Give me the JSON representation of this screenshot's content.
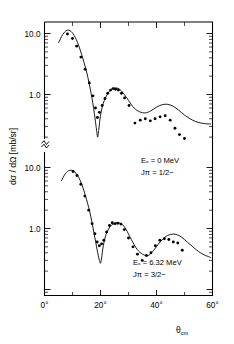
{
  "figure": {
    "name": "differential-cross-section-angular-distribution",
    "background": "#ffffff",
    "ink_color": "#000000"
  },
  "axes": {
    "x": {
      "label_main": "θ",
      "label_sub": "cm",
      "min": 0,
      "max": 60,
      "unit": "deg",
      "major_ticks": [
        0,
        20,
        40,
        60
      ],
      "major_tick_labels": [
        "0°",
        "20°",
        "40°",
        "60°"
      ],
      "minor_ticks": [
        10,
        30,
        50
      ]
    },
    "y": {
      "label": "dσ / dΩ [mb/sr]",
      "scale": "log",
      "unit": "mb/sr",
      "axis_break": true,
      "axis_break_symbol": "≈",
      "panel_tick_labels": [
        "10.0",
        "1.0"
      ]
    }
  },
  "chart_data": {
    "type": "scatter",
    "title": "",
    "xlabel": "θ_cm",
    "ylabel": "dσ / dΩ [mb/sr]",
    "xlim": [
      0,
      60
    ],
    "yscale": "log",
    "grid": false,
    "legend": "none",
    "panels": [
      {
        "id": "upper-panel",
        "annotation_lines": [
          "E",
          "x",
          " = 0 MeV",
          "J",
          "π",
          " = 1/2",
          "−"
        ],
        "annotation_excitation": "Eₓ = 0 MeV",
        "annotation_spin_parity": "Jπ = 1/2−",
        "excitation_energy_MeV": 0,
        "spin": "1/2",
        "parity": "-",
        "ylim": [
          0.1,
          30
        ],
        "ytick_values": [
          10.0,
          1.0
        ],
        "ytick_labels": [
          "10.0",
          "1.0"
        ],
        "series": [
          {
            "name": "experimental-data",
            "marker": "filled-circle",
            "x": [
              8.2,
              10.0,
              11.5,
              13.0,
              14.5,
              16.0,
              17.3,
              18.2,
              18.9,
              19.6,
              20.6,
              21.6,
              22.6,
              23.6,
              24.5,
              25.4,
              26.4,
              27.5,
              28.6,
              30.2,
              32.3,
              34.2,
              36.0,
              37.8,
              39.5,
              41.3,
              43.1,
              44.9,
              46.6,
              48.2,
              50.0
            ],
            "y": [
              9.8,
              8.3,
              6.2,
              4.1,
              2.6,
              1.55,
              0.95,
              0.6,
              0.42,
              0.51,
              0.66,
              0.86,
              1.05,
              1.18,
              1.25,
              1.22,
              1.18,
              1.05,
              0.88,
              0.66,
              0.34,
              0.38,
              0.4,
              0.37,
              0.4,
              0.43,
              0.45,
              0.38,
              0.28,
              0.22,
              0.19
            ]
          },
          {
            "name": "theory-curve",
            "style": "solid-line",
            "x": [
              5.0,
              6.5,
              8.0,
              9.5,
              11.0,
              12.5,
              14.0,
              15.5,
              17.0,
              18.0,
              18.6,
              19.0,
              19.4,
              20.0,
              21.0,
              22.5,
              24.0,
              25.5,
              27.0,
              28.5,
              30.0,
              32.0,
              34.0,
              36.0,
              38.0,
              40.0,
              42.0,
              44.0,
              46.0,
              48.0,
              50.0,
              52.0,
              54.0,
              56.0,
              58.0,
              59.5
            ],
            "y": [
              7.0,
              9.6,
              11.3,
              10.8,
              8.6,
              5.8,
              3.5,
              1.9,
              0.85,
              0.42,
              0.26,
              0.2,
              0.27,
              0.45,
              0.72,
              1.02,
              1.22,
              1.28,
              1.2,
              1.0,
              0.8,
              0.6,
              0.52,
              0.5,
              0.54,
              0.62,
              0.68,
              0.69,
              0.64,
              0.55,
              0.46,
              0.4,
              0.36,
              0.34,
              0.33,
              0.33
            ]
          }
        ]
      },
      {
        "id": "lower-panel",
        "annotation_excitation": "Eₓ = 6.32 MeV",
        "annotation_spin_parity": "Jπ = 3/2−",
        "excitation_energy_MeV": 6.32,
        "spin": "3/2",
        "parity": "-",
        "ylim": [
          0.1,
          30
        ],
        "ytick_values": [
          10.0,
          1.0
        ],
        "ytick_labels": [
          "10.0",
          "1.0"
        ],
        "series": [
          {
            "name": "experimental-data",
            "marker": "filled-circle",
            "x": [
              10.2,
              11.6,
              13.0,
              14.4,
              15.8,
              17.0,
              18.0,
              18.8,
              19.6,
              20.4,
              21.2,
              22.2,
              23.2,
              24.2,
              25.2,
              26.2,
              27.3,
              28.5,
              30.0,
              31.6,
              33.2,
              34.9,
              36.4,
              38.0,
              39.6,
              41.2,
              42.8,
              44.4,
              46.0,
              47.6,
              49.2
            ],
            "y": [
              8.6,
              7.4,
              5.3,
              3.4,
              2.0,
              1.2,
              0.82,
              0.6,
              0.52,
              0.56,
              0.64,
              0.88,
              1.12,
              1.24,
              1.2,
              1.22,
              1.18,
              0.96,
              0.7,
              0.5,
              0.38,
              0.3,
              0.36,
              0.4,
              0.52,
              0.64,
              0.68,
              0.66,
              0.6,
              0.58,
              0.44
            ]
          },
          {
            "name": "theory-curve",
            "style": "solid-line",
            "x": [
              6.0,
              7.5,
              9.0,
              10.5,
              12.0,
              13.5,
              15.0,
              16.5,
              18.0,
              19.0,
              19.6,
              20.0,
              20.4,
              21.0,
              22.0,
              23.5,
              25.0,
              26.5,
              28.0,
              29.5,
              31.0,
              33.0,
              35.0,
              37.0,
              39.0,
              41.0,
              43.0,
              45.0,
              47.0,
              49.0,
              51.0,
              53.0,
              55.0,
              57.0,
              59.0,
              59.5
            ],
            "y": [
              6.0,
              8.0,
              9.0,
              8.6,
              7.2,
              5.0,
              3.0,
              1.6,
              0.7,
              0.4,
              0.3,
              0.27,
              0.33,
              0.52,
              0.8,
              1.08,
              1.2,
              1.24,
              1.14,
              0.9,
              0.66,
              0.46,
              0.38,
              0.36,
              0.44,
              0.58,
              0.72,
              0.8,
              0.8,
              0.72,
              0.6,
              0.5,
              0.42,
              0.37,
              0.34,
              0.33
            ]
          }
        ]
      }
    ]
  }
}
